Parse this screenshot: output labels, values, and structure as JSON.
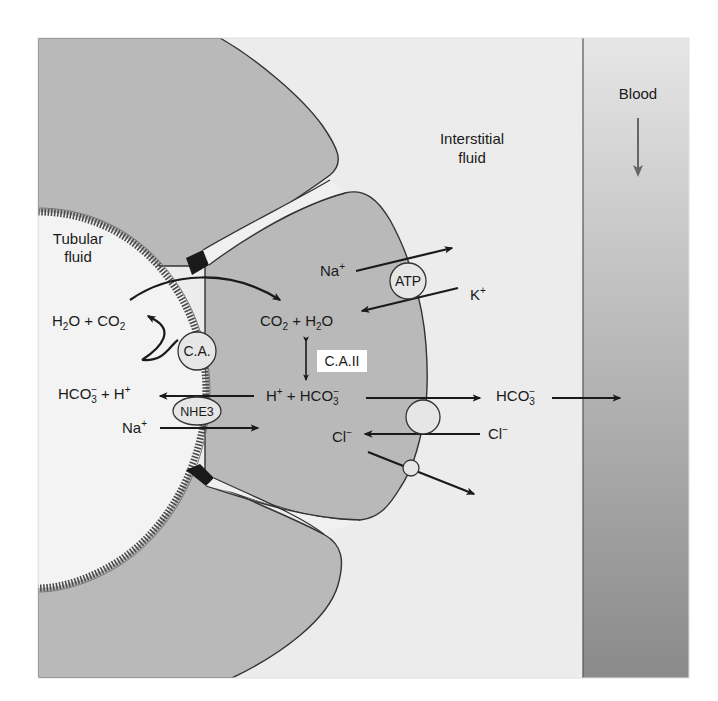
{
  "figure": {
    "type": "physiology-diagram"
  },
  "compartments": {
    "tubular_fluid": {
      "line1": "Tubular",
      "line2": "fluid"
    },
    "interstitial_fluid": {
      "line1": "Interstitial",
      "line2": "fluid"
    },
    "blood": {
      "label": "Blood"
    }
  },
  "lumen_reactions": {
    "top": {
      "a": "H",
      "a_sub": "2",
      "b": "O + CO",
      "b_sub": "2"
    },
    "bottom": {
      "a": "HCO",
      "a_sub": "3",
      "a_sup": "−",
      "b": " + H",
      "b_sup": "+"
    },
    "na": {
      "a": "Na",
      "a_sup": "+"
    }
  },
  "cell_reactions": {
    "top": {
      "a": "CO",
      "a_sub": "2",
      "b": " + H",
      "b_sub": "2",
      "c": "O"
    },
    "bottom": {
      "a": "H",
      "a_sup": "+",
      "b": " + HCO",
      "b_sub": "3",
      "b_sup": "−"
    },
    "na": {
      "a": "Na",
      "a_sup": "+"
    },
    "k": {
      "a": "K",
      "a_sup": "+"
    },
    "cl_in": {
      "a": "Cl",
      "a_sup": "−"
    }
  },
  "interstitial_ions": {
    "hco3": {
      "a": "HCO",
      "a_sub": "3",
      "a_sup": "−"
    },
    "cl": {
      "a": "Cl",
      "a_sup": "−"
    }
  },
  "enzymes_transporters": {
    "carbonic_anhydrase_luminal": "C.A.",
    "carbonic_anhydrase_cytosolic": "C.A.II",
    "na_k_pump": "ATP",
    "na_h_exchanger": "NHE3"
  },
  "colors": {
    "frame_background": "#ececec",
    "cell_fill": "#b9b9b9",
    "lumen_fill": "#f2f2f2",
    "blood_top": "#e4e4e4",
    "blood_bottom": "#8c8c8c",
    "outline": "#333333",
    "brush_border": "#555555",
    "tight_junction": "#1a1a1a"
  }
}
